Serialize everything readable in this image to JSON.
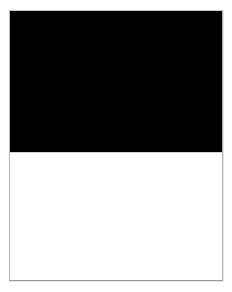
{
  "viewport": {
    "width": 232,
    "height": 292,
    "background_color": "#ffffff"
  },
  "page": {
    "name": "page-sheet",
    "background_color": "#ffffff",
    "border_color": "#b4b4b4",
    "bottom_border_color": "#9a9a9a",
    "x": 9,
    "y": 10,
    "width": 214,
    "height": 271
  },
  "regions": [
    {
      "name": "dark-block",
      "kind": "solid-fill",
      "color": "#000000",
      "x": 0,
      "y": 0,
      "width": 214,
      "height": 141,
      "text": ""
    },
    {
      "name": "divider-line",
      "kind": "hairline",
      "color": "#d2d2d2",
      "x": 0,
      "y": 141,
      "width": 214,
      "height": 1,
      "text": ""
    },
    {
      "name": "blank-block",
      "kind": "solid-fill",
      "color": "#ffffff",
      "x": 0,
      "y": 142,
      "width": 214,
      "height": 129,
      "text": ""
    }
  ],
  "shadow": {
    "color": "#e6e6e6"
  },
  "accessibility": {
    "page_description": "Blank document page with a solid black upper band and an empty white lower area"
  }
}
